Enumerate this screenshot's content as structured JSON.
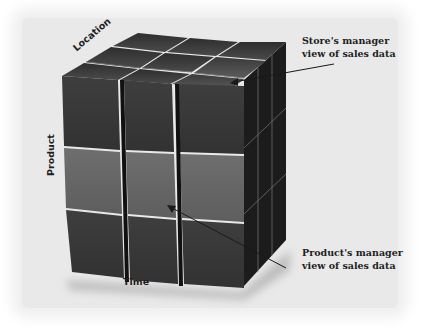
{
  "diagram": {
    "type": "olap-data-cube",
    "axes": {
      "x": "Time",
      "y": "Product",
      "z": "Location"
    },
    "grid": {
      "rows": 3,
      "columns": 3,
      "depth": 3
    },
    "callouts": [
      {
        "id": "store",
        "lines": [
          "Store's manager",
          "view of sales data"
        ],
        "highlight": "right column slice (one location)"
      },
      {
        "id": "product",
        "lines": [
          "Product's manager",
          "view of sales data"
        ],
        "highlight": "middle row slice (one product)"
      }
    ],
    "colors": {
      "background": "#e9e9e9",
      "cube_dark": "#3a3a3a",
      "cube_mid": "#454545",
      "slice_light": "#666666",
      "side_face": "#1c1c1c",
      "text": "#1e1e1e"
    }
  }
}
